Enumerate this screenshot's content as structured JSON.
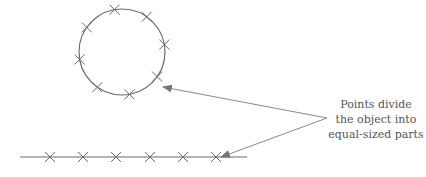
{
  "annotation": {
    "lines": [
      "Points divide",
      "the object into",
      "equal-sized parts"
    ]
  },
  "colors": {
    "stroke": "#6a6a6a",
    "arrow": "#888888",
    "text": "#555555"
  },
  "circle": {
    "cx": 122,
    "cy": 52,
    "r": 43,
    "points": 8
  },
  "segment": {
    "x1": 20,
    "x2": 247,
    "y": 157,
    "marks_x": [
      50,
      83,
      116,
      150,
      183,
      216
    ]
  },
  "arrow_origin": {
    "x": 327,
    "y": 118
  },
  "arrow_targets": [
    {
      "x": 163,
      "y": 87
    },
    {
      "x": 221,
      "y": 157
    }
  ]
}
